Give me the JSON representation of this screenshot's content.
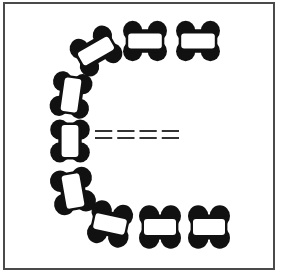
{
  "figure": {
    "frame_color": "#4a4a4a",
    "fill_color": "#111111",
    "window_color": "#ffffff",
    "background": "#ffffff"
  },
  "blocks": [
    {
      "id": "top-1",
      "cx": 96,
      "cy": 51,
      "w": 44,
      "h": 30,
      "rotate": -30
    },
    {
      "id": "top-2",
      "cx": 145,
      "cy": 41,
      "w": 42,
      "h": 30,
      "rotate": 0
    },
    {
      "id": "top-3",
      "cx": 198,
      "cy": 41,
      "w": 42,
      "h": 30,
      "rotate": 0
    },
    {
      "id": "left-1",
      "cx": 71,
      "cy": 95,
      "w": 30,
      "h": 42,
      "rotate": 8
    },
    {
      "id": "left-2",
      "cx": 70,
      "cy": 141,
      "w": 30,
      "h": 40,
      "rotate": 0
    },
    {
      "id": "left-3",
      "cx": 73,
      "cy": 191,
      "w": 32,
      "h": 42,
      "rotate": -10
    },
    {
      "id": "bottom-1",
      "cx": 110,
      "cy": 224,
      "w": 40,
      "h": 32,
      "rotate": 12
    },
    {
      "id": "bottom-2",
      "cx": 160,
      "cy": 227,
      "w": 40,
      "h": 32,
      "rotate": 0
    },
    {
      "id": "bottom-3",
      "cx": 209,
      "cy": 227,
      "w": 40,
      "h": 32,
      "rotate": 0
    }
  ],
  "marker": {
    "type": "dashed-double-line",
    "x_start": 95,
    "x_end": 184,
    "y1": 131,
    "y2": 138,
    "dash_count": 4
  }
}
